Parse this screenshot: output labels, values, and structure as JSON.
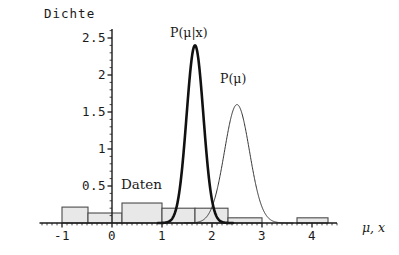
{
  "chart_data": {
    "type": "area",
    "title": "",
    "ylabel": "Dichte",
    "xlabel": "μ, x",
    "xlim": [
      -1.45,
      4.5
    ],
    "ylim": [
      0,
      2.62
    ],
    "grid": false,
    "legend": "inline-annotations",
    "axis": {
      "x_ticks": [
        -1,
        0,
        1,
        2,
        3,
        4
      ],
      "x_tick_labels": [
        "-1",
        "0",
        "1",
        "2",
        "3",
        "4"
      ],
      "y_ticks": [
        0.5,
        1,
        1.5,
        2,
        2.5
      ],
      "y_tick_labels": [
        "0.5",
        "1",
        "1.5",
        "2",
        "2.5"
      ],
      "x_minor_step": 0.1,
      "y_minor_step": 0.1
    },
    "annotations": [
      {
        "name": "posterior-label",
        "text": "P(μ|x)",
        "x": 1.66,
        "y": 2.55
      },
      {
        "name": "prior-label",
        "text": "P(μ)",
        "x": 2.52,
        "y": 1.93
      },
      {
        "name": "data-label",
        "text": "Daten",
        "x": 0.62,
        "y": 0.52
      }
    ],
    "series": [
      {
        "name": "P(μ|x)",
        "type": "line",
        "style": "thick",
        "distribution": "normal",
        "mean": 1.66,
        "sigma": 0.168,
        "peak": 2.4,
        "peak_x": 1.66
      },
      {
        "name": "P(μ)",
        "type": "line",
        "style": "thin",
        "distribution": "normal",
        "mean": 2.5,
        "sigma": 0.25,
        "peak": 1.6,
        "peak_x": 2.5
      },
      {
        "name": "Daten",
        "type": "histogram",
        "fill": "#e8e8e8",
        "edge": "#4a4a4a",
        "bins": [
          {
            "x0": -1.0,
            "x1": -0.48,
            "height": 0.215
          },
          {
            "x0": -0.48,
            "x1": 0.2,
            "height": 0.135
          },
          {
            "x0": 0.2,
            "x1": 1.0,
            "height": 0.27
          },
          {
            "x0": 1.0,
            "x1": 1.66,
            "height": 0.2
          },
          {
            "x0": 1.66,
            "x1": 2.32,
            "height": 0.2
          },
          {
            "x0": 2.32,
            "x1": 3.0,
            "height": 0.07
          },
          {
            "x0": 3.7,
            "x1": 4.32,
            "height": 0.07
          }
        ]
      }
    ]
  },
  "colors": {
    "axis": "#1a1a1a",
    "hist_fill": "#e8e8e8",
    "hist_edge": "#4a4a4a",
    "posterior": "#111111",
    "prior": "#333333",
    "background": "#ffffff"
  }
}
